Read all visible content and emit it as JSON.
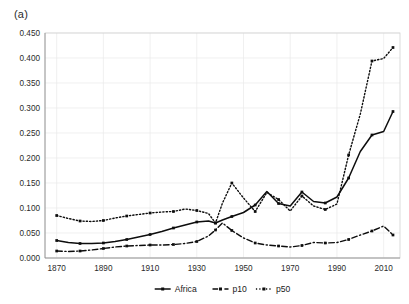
{
  "figure": {
    "panel_label": "(a)"
  },
  "chart_data": {
    "type": "line",
    "title": "",
    "xlabel": "",
    "ylabel": "",
    "xlim": [
      1865,
      2017
    ],
    "ylim": [
      0.0,
      0.45
    ],
    "grid": true,
    "legend_position": "bottom",
    "y_ticks": [
      "0.000",
      "0.050",
      "0.100",
      "0.150",
      "0.200",
      "0.250",
      "0.300",
      "0.350",
      "0.400",
      "0.450"
    ],
    "y_tick_values": [
      0.0,
      0.05,
      0.1,
      0.15,
      0.2,
      0.25,
      0.3,
      0.35,
      0.4,
      0.45
    ],
    "x_ticks": [
      "1870",
      "1890",
      "1910",
      "1930",
      "1950",
      "1970",
      "1990",
      "2010"
    ],
    "x_tick_values": [
      1870,
      1890,
      1910,
      1930,
      1950,
      1970,
      1990,
      2010
    ],
    "series": [
      {
        "name": "Africa",
        "style": "solid",
        "color": "#0d0d0d",
        "marker": "square",
        "x": [
          1870,
          1875,
          1880,
          1885,
          1890,
          1895,
          1900,
          1905,
          1910,
          1915,
          1920,
          1925,
          1930,
          1935,
          1938,
          1941,
          1945,
          1950,
          1955,
          1960,
          1965,
          1970,
          1975,
          1980,
          1985,
          1990,
          1995,
          2000,
          2005,
          2010,
          2014
        ],
        "values": [
          0.035,
          0.031,
          0.029,
          0.029,
          0.03,
          0.033,
          0.037,
          0.042,
          0.047,
          0.053,
          0.06,
          0.066,
          0.072,
          0.074,
          0.07,
          0.076,
          0.083,
          0.091,
          0.106,
          0.133,
          0.109,
          0.104,
          0.132,
          0.113,
          0.11,
          0.122,
          0.16,
          0.213,
          0.246,
          0.253,
          0.293
        ]
      },
      {
        "name": "p10",
        "style": "dashdot",
        "color": "#0d0d0d",
        "marker": "square",
        "x": [
          1870,
          1875,
          1880,
          1885,
          1890,
          1895,
          1900,
          1905,
          1910,
          1915,
          1920,
          1925,
          1930,
          1935,
          1938,
          1941,
          1945,
          1950,
          1955,
          1960,
          1965,
          1970,
          1975,
          1980,
          1985,
          1990,
          1995,
          2000,
          2005,
          2010,
          2014
        ],
        "values": [
          0.014,
          0.013,
          0.014,
          0.016,
          0.019,
          0.022,
          0.024,
          0.025,
          0.026,
          0.026,
          0.027,
          0.029,
          0.033,
          0.044,
          0.056,
          0.07,
          0.055,
          0.04,
          0.03,
          0.026,
          0.024,
          0.022,
          0.025,
          0.031,
          0.03,
          0.031,
          0.037,
          0.046,
          0.054,
          0.064,
          0.046
        ]
      },
      {
        "name": "p50",
        "style": "dotted",
        "color": "#0d0d0d",
        "marker": "square",
        "x": [
          1870,
          1875,
          1880,
          1885,
          1890,
          1895,
          1900,
          1905,
          1910,
          1915,
          1920,
          1925,
          1930,
          1935,
          1938,
          1941,
          1945,
          1950,
          1955,
          1960,
          1965,
          1970,
          1975,
          1980,
          1985,
          1990,
          1995,
          2000,
          2005,
          2010,
          2014
        ],
        "values": [
          0.085,
          0.079,
          0.074,
          0.073,
          0.075,
          0.08,
          0.084,
          0.087,
          0.09,
          0.092,
          0.093,
          0.098,
          0.095,
          0.089,
          0.07,
          0.11,
          0.15,
          0.12,
          0.093,
          0.131,
          0.117,
          0.094,
          0.124,
          0.104,
          0.097,
          0.108,
          0.206,
          0.288,
          0.394,
          0.399,
          0.421
        ]
      }
    ],
    "legend": [
      {
        "label": "Africa",
        "style": "solid"
      },
      {
        "label": "p10",
        "style": "dashdot"
      },
      {
        "label": "p50",
        "style": "dotted"
      }
    ]
  }
}
